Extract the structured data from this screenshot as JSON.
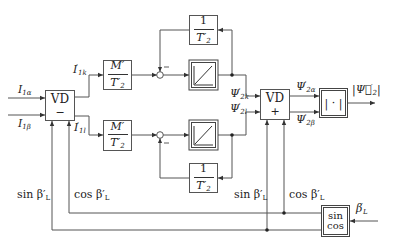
{
  "diagram": {
    "type": "block-diagram",
    "inputs": {
      "i1_alpha": "I",
      "i1_alpha_sub": "1α",
      "i1_beta": "I",
      "i1_beta_sub": "1β",
      "beta_L": "β",
      "beta_L_sup": "′",
      "beta_L_sub": "L"
    },
    "blocks": {
      "vd_left": {
        "label": "VD",
        "sign": "−"
      },
      "vd_right": {
        "label": "VD",
        "sign": "+"
      },
      "gain_top": {
        "num": "M′",
        "den": "T′",
        "den_sub": "2"
      },
      "gain_bottom": {
        "num": "M′",
        "den": "T′",
        "den_sub": "2"
      },
      "feedback_top": {
        "num": "1",
        "den": "T′",
        "den_sub": "2"
      },
      "feedback_bottom": {
        "num": "1",
        "den": "T′",
        "den_sub": "2"
      },
      "integrator_top": {
        "kind": "integrator"
      },
      "integrator_bottom": {
        "kind": "integrator"
      },
      "magnitude": {
        "label": "| · |"
      },
      "sincos": {
        "line1": "sin",
        "line2": "cos"
      }
    },
    "summers": {
      "top_sign": "−",
      "bottom_sign": "−"
    },
    "signals": {
      "i1k": "I",
      "i1k_sup": "′",
      "i1k_sub": "1k",
      "i1l": "I",
      "i1l_sup": "′",
      "i1l_sub": "1l",
      "psi2k": "Ψ",
      "psi2k_sup": "′",
      "psi2k_sub": "2k",
      "psi2l": "Ψ",
      "psi2l_sup": "′",
      "psi2l_sub": "2l",
      "psi2a": "Ψ",
      "psi2a_sup": "′",
      "psi2a_sub": "2α",
      "psi2b": "Ψ",
      "psi2b_sup": "′",
      "psi2b_sub": "2β",
      "output": "|Ψ⃗",
      "output_sup": "′",
      "output_sub": "2",
      "output_close": "|",
      "sin_left": "sin β′",
      "sin_left_sub": "L",
      "cos_left": "cos β′",
      "cos_left_sub": "L",
      "sin_right": "sin β′",
      "sin_right_sub": "L",
      "cos_right": "cos β′",
      "cos_right_sub": "L"
    },
    "colors": {
      "line": "#555555",
      "text": "#222222",
      "background": "#ffffff"
    }
  }
}
